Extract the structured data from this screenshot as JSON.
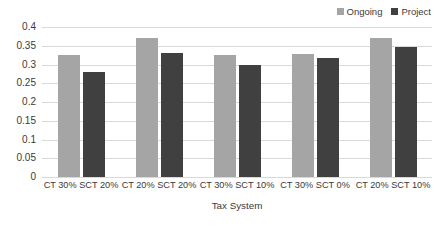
{
  "chart_data": {
    "type": "bar",
    "title": "",
    "xlabel": "Tax System",
    "ylabel": "",
    "categories": [
      "CT 30% SCT 20%",
      "CT 20% SCT 20%",
      "CT 30% SCT 10%",
      "CT 30% SCT 0%",
      "CT 20% SCT 10%"
    ],
    "series": [
      {
        "name": "Ongoing",
        "color": "#a5a5a5",
        "values": [
          0.325,
          0.37,
          0.325,
          0.327,
          0.37
        ]
      },
      {
        "name": "Project",
        "color": "#404040",
        "values": [
          0.28,
          0.331,
          0.298,
          0.318,
          0.348
        ]
      }
    ],
    "ylim": [
      0,
      0.4
    ],
    "yticks": [
      "0.4",
      "0.35",
      "0.3",
      "0.25",
      "0.2",
      "0.15",
      "0.1",
      "0.05",
      "0"
    ],
    "ytick_values": [
      0.4,
      0.35,
      0.3,
      0.25,
      0.2,
      0.15,
      0.1,
      0.05,
      0
    ],
    "grid": true,
    "legend_position": "top-right",
    "gridline_color": "#d9d9d9",
    "text_color": "#3a3a3a",
    "background": "#ffffff"
  },
  "legend": {
    "entries": [
      {
        "label": "Ongoing",
        "color": "#a5a5a5"
      },
      {
        "label": "Project",
        "color": "#404040"
      }
    ]
  },
  "axes": {
    "x_title": "Tax System"
  }
}
